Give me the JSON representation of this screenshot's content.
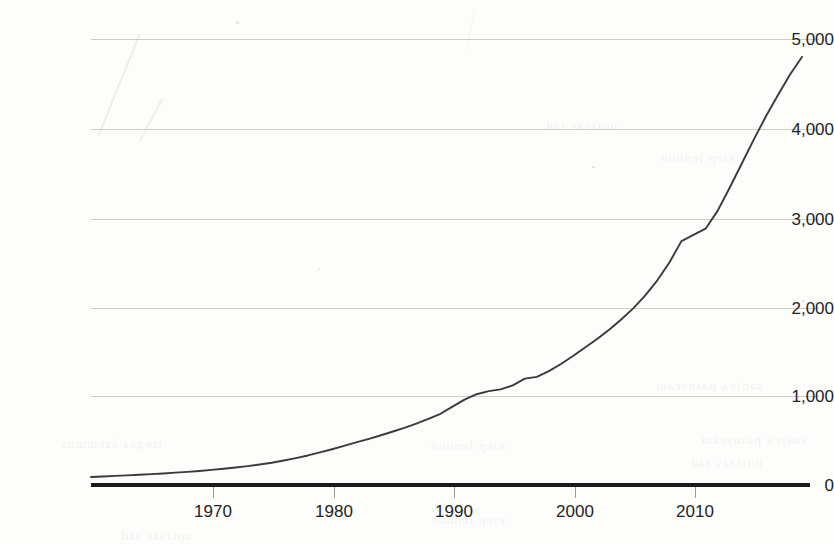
{
  "chart_data": {
    "type": "line",
    "title": "",
    "subtitle": "",
    "xlabel": "",
    "ylabel": "",
    "xlim": [
      1960,
      2019
    ],
    "ylim": [
      0,
      5200
    ],
    "grid": true,
    "legend_position": "none",
    "y_ticks": [
      0,
      1000,
      2000,
      3000,
      4000,
      5000
    ],
    "y_tick_labels": [
      "0",
      "1,000",
      "2,000",
      "3,000",
      "4,000",
      "5,000"
    ],
    "x_ticks": [
      1970,
      1980,
      1990,
      2000,
      2010
    ],
    "x_tick_labels": [
      "1970",
      "1980",
      "1990",
      "2000",
      "2010"
    ],
    "series": [
      {
        "name": "series-1",
        "color": "#3a3a3a",
        "x": [
          1960,
          1961,
          1962,
          1963,
          1964,
          1965,
          1966,
          1967,
          1968,
          1969,
          1970,
          1971,
          1972,
          1973,
          1974,
          1975,
          1976,
          1977,
          1978,
          1979,
          1980,
          1981,
          1982,
          1983,
          1984,
          1985,
          1986,
          1987,
          1988,
          1989,
          1990,
          1991,
          1992,
          1993,
          1994,
          1995,
          1996,
          1997,
          1998,
          1999,
          2000,
          2001,
          2002,
          2003,
          2004,
          2005,
          2006,
          2007,
          2008,
          2009,
          2010,
          2011,
          2012,
          2013,
          2014,
          2015,
          2016,
          2017,
          2018,
          2019
        ],
        "values": [
          90,
          96,
          102,
          108,
          115,
          122,
          130,
          139,
          148,
          158,
          170,
          182,
          196,
          212,
          230,
          250,
          275,
          302,
          332,
          366,
          402,
          440,
          478,
          516,
          556,
          598,
          642,
          690,
          742,
          800,
          880,
          960,
          1020,
          1055,
          1075,
          1120,
          1195,
          1215,
          1280,
          1360,
          1450,
          1545,
          1640,
          1745,
          1860,
          1985,
          2130,
          2300,
          2500,
          2740,
          2810,
          2880,
          3080,
          3340,
          3610,
          3880,
          4140,
          4380,
          4610,
          4810
        ]
      }
    ]
  },
  "axes": {
    "y_tick_labels": [
      "5,000",
      "4,000",
      "3,000",
      "2,000",
      "1,000",
      "0"
    ],
    "x_tick_labels": [
      "1970",
      "1980",
      "1990",
      "2000",
      "2010"
    ]
  },
  "style": {
    "line_color": "#3a3a3a",
    "grid_color": "#c5c5c0",
    "axis_color": "#1a1a1a",
    "text_color": "#232323",
    "background": "#fdfdfc"
  },
  "artifacts": {
    "bleed_lines": [
      "sənjɐʌ pəɹnsɐəɯ",
      "uoıʇɔəs ɹəd",
      "ɐʇɐp lɐnuuɐ",
      "ʇɹoдəɹ ʎɹɐɯɯns"
    ]
  }
}
